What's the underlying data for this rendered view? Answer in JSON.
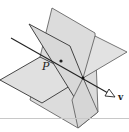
{
  "figure": {
    "labels": {
      "point": "P",
      "vector": "v"
    },
    "colors": {
      "plane_fill": "#dcdcdc",
      "edge": "#333333",
      "background": "#ffffff"
    }
  }
}
